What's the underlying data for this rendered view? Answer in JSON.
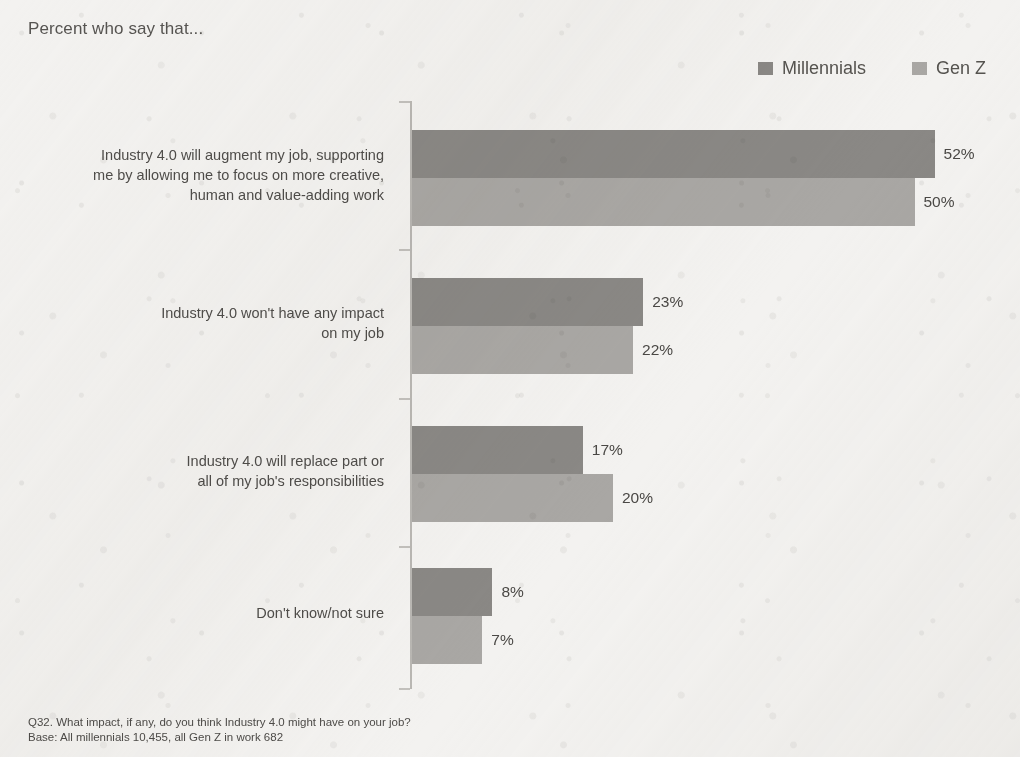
{
  "chart_data": {
    "type": "bar",
    "orientation": "horizontal",
    "title": "Percent who say that...",
    "xlabel": "",
    "ylabel": "",
    "grid": false,
    "legend_position": "top-right",
    "xlim": [
      0,
      52
    ],
    "value_suffix": "%",
    "categories": [
      "Industry 4.0 will augment my job, supporting me by allowing me to focus on more creative, human and value-adding work",
      "Industry 4.0 won't have any impact on my job",
      "Industry 4.0 will replace part or all of my job's responsibilities",
      "Don't know/not sure"
    ],
    "category_lines": [
      [
        "Industry 4.0 will augment my job, supporting",
        "me by allowing me to focus on more creative,",
        "human and value-adding work"
      ],
      [
        "Industry 4.0 won't have any impact",
        "on my job"
      ],
      [
        "Industry 4.0 will replace part or",
        "all of my job's responsibilities"
      ],
      [
        "Don't know/not sure"
      ]
    ],
    "series": [
      {
        "name": "Millennials",
        "color": "#8a8885",
        "values": [
          52,
          23,
          17,
          8
        ],
        "value_labels": [
          "52%",
          "23%",
          "17%",
          "8%"
        ]
      },
      {
        "name": "Gen Z",
        "color": "#a9a7a4",
        "values": [
          50,
          22,
          20,
          7
        ],
        "value_labels": [
          "50%",
          "22%",
          "20%",
          "7%"
        ]
      }
    ]
  },
  "legend": {
    "items": [
      {
        "label": "Millennials",
        "color": "#8a8885"
      },
      {
        "label": "Gen Z",
        "color": "#a9a7a4"
      }
    ]
  },
  "footnotes": {
    "question": "Q32. What impact, if any, do you think Industry 4.0 might have on your job?",
    "base": "Base: All millennials 10,455, all Gen Z in work 682"
  }
}
